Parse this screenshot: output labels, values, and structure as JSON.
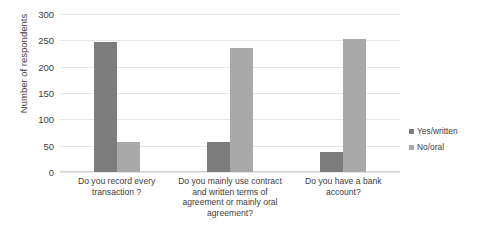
{
  "chart_data": {
    "type": "bar",
    "title": "",
    "xlabel": "",
    "ylabel": "Number of respondents",
    "ylim": [
      0,
      300
    ],
    "ytick_step": 50,
    "yticks": [
      300,
      250,
      200,
      150,
      100,
      50,
      0
    ],
    "grid": true,
    "legend_position": "right",
    "categories": [
      "Do you record every transaction ?",
      "Do you mainly use contract and written terms of agreement or mainly oral agreement?",
      "Do you have a bank account?"
    ],
    "category_lines": [
      [
        "Do you record every",
        "transaction ?"
      ],
      [
        "Do you mainly use contract",
        "and written terms of",
        "agreement or mainly oral",
        "agreement?"
      ],
      [
        "Do you have a bank account?"
      ]
    ],
    "series": [
      {
        "name": "Yes/written",
        "color": "#7c7c7c",
        "values": [
          247,
          57,
          38
        ]
      },
      {
        "name": "No/oral",
        "color": "#a9a9a9",
        "values": [
          57,
          236,
          252
        ]
      }
    ]
  }
}
